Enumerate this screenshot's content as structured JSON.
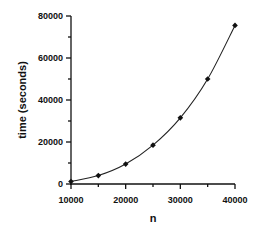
{
  "chart_data": {
    "type": "line",
    "title": "",
    "xlabel": "n",
    "ylabel": "time (seconds)",
    "x": [
      10000,
      15000,
      20000,
      25000,
      30000,
      35000,
      40000
    ],
    "series": [
      {
        "name": "time",
        "values": [
          1200,
          4000,
          9500,
          18500,
          31500,
          50000,
          75500
        ]
      }
    ],
    "xlim": [
      10000,
      40000
    ],
    "ylim": [
      0,
      80000
    ],
    "xticks": [
      "10000",
      "20000",
      "30000",
      "40000"
    ],
    "yticks": [
      "0",
      "20000",
      "40000",
      "60000",
      "80000"
    ],
    "grid": false,
    "legend": null
  }
}
